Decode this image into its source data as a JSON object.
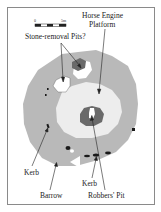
{
  "figure": {
    "type": "archaeological site plan",
    "colors": {
      "frame": "#8a8a8a",
      "barrow": "#b9b9b9",
      "platform": "#ededed",
      "pit_dark": "#6a6a6a",
      "stone": "#1a1a1a",
      "white": "#ffffff",
      "arrow": "#222222"
    },
    "scale_bar": {
      "start_label": "0",
      "end_label": "5m"
    },
    "labels": {
      "horse_engine_line1": "Horse Engine",
      "horse_engine_line2": "Platform",
      "stone_removal": "Stone-removal Pits?",
      "kerb_left": "Kerb",
      "kerb_bottom": "Kerb",
      "barrow": "Barrow",
      "robbers_pit": "Robbers' Pit"
    }
  }
}
